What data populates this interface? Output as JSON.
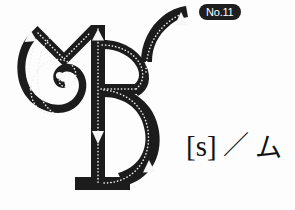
{
  "page": {
    "background_color": "#fdfdfd",
    "ink_color": "#1c1c1c",
    "guide_color": "#f2f2f2",
    "width": 295,
    "height": 210
  },
  "badge": {
    "label": "No.11",
    "background_color": "#1e1e1e",
    "text_color": "#ffffff"
  },
  "reading": {
    "latin": "[s]",
    "separator": "／",
    "kana": "ム"
  },
  "glyph": {
    "name": "calligraphic-letter",
    "description": "Ornate blackletter-style letterform with dotted stroke-order guides",
    "stroke_color": "#1c1c1c",
    "guide_dot_color": "#f0f0f0",
    "arrow_color": "#f7f7f7",
    "stroke_count": 5,
    "strokes": [
      {
        "order": 1,
        "name": "left-spiral-stroke",
        "direction": "up"
      },
      {
        "order": 2,
        "name": "m-shoulder-stroke",
        "direction": "up"
      },
      {
        "order": 3,
        "name": "right-tail-stroke",
        "direction": "up"
      },
      {
        "order": 4,
        "name": "vertical-stem-stroke",
        "direction": "down"
      },
      {
        "order": 5,
        "name": "lower-bowl-stroke",
        "direction": "up"
      }
    ]
  }
}
